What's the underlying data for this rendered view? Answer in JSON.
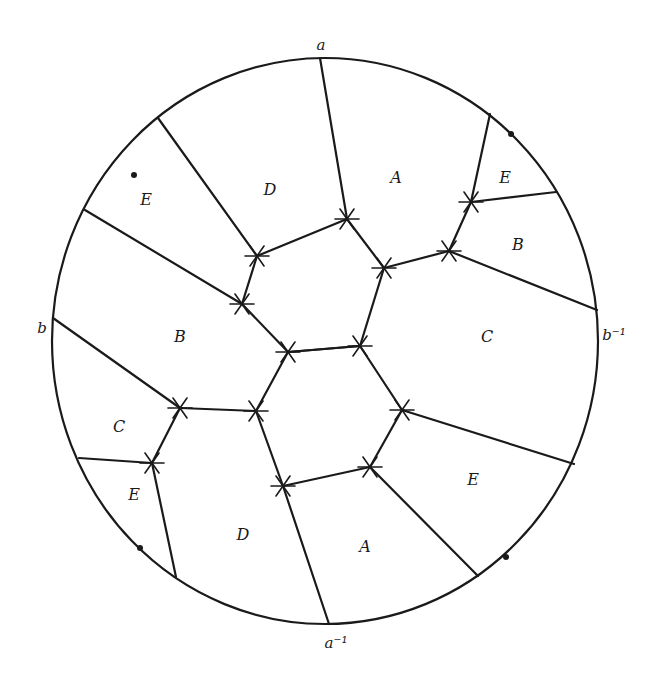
{
  "figure": {
    "boundary_labels": {
      "top": "a",
      "bottom": "a⁻¹",
      "left": "b",
      "right": "b⁻¹"
    },
    "region_labels": [
      {
        "text": "D",
        "x": 270,
        "y": 195
      },
      {
        "text": "A",
        "x": 396,
        "y": 183
      },
      {
        "text": "E",
        "x": 505,
        "y": 183
      },
      {
        "text": "E",
        "x": 146,
        "y": 205
      },
      {
        "text": "B",
        "x": 518,
        "y": 250
      },
      {
        "text": "B",
        "x": 180,
        "y": 342
      },
      {
        "text": "C",
        "x": 487,
        "y": 342
      },
      {
        "text": "C",
        "x": 119,
        "y": 432
      },
      {
        "text": "E",
        "x": 134,
        "y": 500
      },
      {
        "text": "E",
        "x": 473,
        "y": 485
      },
      {
        "text": "D",
        "x": 243,
        "y": 540
      },
      {
        "text": "A",
        "x": 365,
        "y": 552
      }
    ],
    "colors": {
      "ink": "#1a1a1a",
      "background": "#ffffff"
    }
  }
}
